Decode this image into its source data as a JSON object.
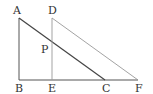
{
  "diagram": {
    "type": "geometry",
    "points": {
      "A": {
        "label": "A",
        "x": 19,
        "y": 18
      },
      "B": {
        "label": "B",
        "x": 19,
        "y": 80
      },
      "C": {
        "label": "C",
        "x": 105,
        "y": 80
      },
      "D": {
        "label": "D",
        "x": 52,
        "y": 18
      },
      "E": {
        "label": "E",
        "x": 52,
        "y": 80
      },
      "F": {
        "label": "F",
        "x": 138,
        "y": 80
      },
      "P": {
        "label": "P",
        "x": 52,
        "y": 41
      }
    },
    "segments": [
      {
        "from": "A",
        "to": "B",
        "style": "dark"
      },
      {
        "from": "B",
        "to": "F",
        "style": "dark"
      },
      {
        "from": "A",
        "to": "C",
        "style": "dark"
      },
      {
        "from": "D",
        "to": "E",
        "style": "light"
      },
      {
        "from": "D",
        "to": "F",
        "style": "light"
      }
    ],
    "colors": {
      "dark": "#444444",
      "light": "#9a9a9a",
      "label": "#333333"
    }
  }
}
